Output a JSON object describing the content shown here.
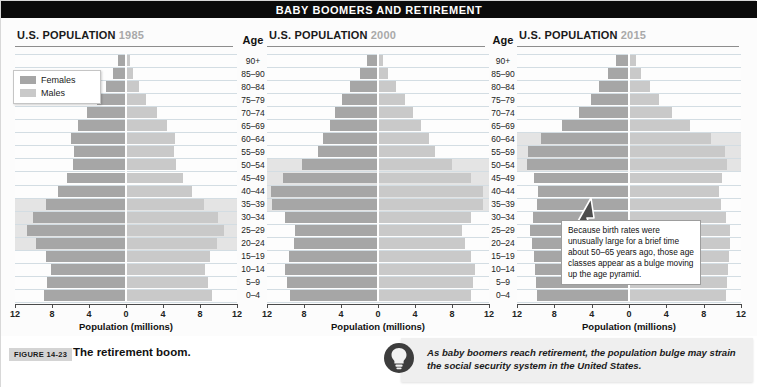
{
  "banner": {
    "title": "BABY BOOMERS AND RETIREMENT"
  },
  "legend": {
    "females_label": "Females",
    "males_label": "Males",
    "female_color": "#a6a6a6",
    "male_color": "#c9c9c9"
  },
  "age_header": "Age",
  "age_groups": [
    "90+",
    "85–90",
    "80–84",
    "75–79",
    "70–74",
    "65–69",
    "60–64",
    "55–59",
    "50–54",
    "45–49",
    "40–44",
    "35–39",
    "30–34",
    "25–29",
    "20–24",
    "15–19",
    "10–14",
    "5–9",
    "0–4"
  ],
  "axis": {
    "ticks": [
      "12",
      "8",
      "4",
      "0",
      "4",
      "8",
      "12"
    ],
    "tick_values": [
      -12,
      -8,
      -4,
      0,
      4,
      8,
      12
    ],
    "xlabel": "Population (millions)",
    "xlim": [
      -12,
      12
    ]
  },
  "panels": [
    {
      "title": "U.S. POPULATION",
      "year": "1985"
    },
    {
      "title": "U.S. POPULATION",
      "year": "2000"
    },
    {
      "title": "U.S. POPULATION",
      "year": "2015"
    }
  ],
  "callout": {
    "text": "Because birth rates were unusually large for a brief time about 50–65 years ago, those age classes appear as a bulge moving up the age pyramid."
  },
  "figure": {
    "label": "FIGURE 14-23",
    "caption": "The retirement boom."
  },
  "note": {
    "icon": "lightbulb-icon",
    "text": "As baby boomers reach retirement, the population bulge may strain the social security system in the United States."
  },
  "chart_data": {
    "type": "bar",
    "title": "BABY BOOMERS AND RETIREMENT",
    "subtitle": "U.S. population age structure pyramids for 1985, 2000 and 2015",
    "xlabel": "Population (millions)",
    "ylabel": "Age",
    "xlim": [
      -12,
      12
    ],
    "grid": true,
    "legend_position": "top-left",
    "categories": [
      "90+",
      "85–90",
      "80–84",
      "75–79",
      "70–74",
      "65–69",
      "60–64",
      "55–59",
      "50–54",
      "45–49",
      "40–44",
      "35–39",
      "30–34",
      "25–29",
      "20–24",
      "15–19",
      "10–14",
      "5–9",
      "0–4"
    ],
    "panels": [
      {
        "year": "1985",
        "bulge_ages": [
          "35–39",
          "30–34",
          "25–29",
          "20–24"
        ],
        "series": [
          {
            "name": "Females",
            "side": "left",
            "values": [
              0.9,
              1.4,
              2.2,
              3.1,
              4.2,
              5.2,
              5.9,
              5.6,
              5.7,
              6.4,
              7.3,
              8.6,
              10.1,
              10.7,
              9.7,
              8.7,
              8.1,
              8.5,
              8.9
            ]
          },
          {
            "name": "Males",
            "side": "right",
            "values": [
              0.4,
              0.8,
              1.4,
              2.2,
              3.3,
              4.4,
              5.3,
              5.2,
              5.4,
              6.2,
              7.1,
              8.4,
              9.9,
              10.6,
              9.8,
              9.1,
              8.5,
              8.9,
              9.3
            ]
          }
        ]
      },
      {
        "year": "2000",
        "bulge_ages": [
          "50–54",
          "45–49",
          "40–44",
          "35–39"
        ],
        "series": [
          {
            "name": "Females",
            "side": "left",
            "values": [
              1.2,
              1.9,
              3.0,
              3.9,
              4.6,
              5.2,
              5.9,
              6.5,
              8.2,
              10.3,
              11.6,
              11.5,
              10.1,
              9.0,
              9.1,
              9.6,
              10.0,
              9.8,
              9.5
            ]
          },
          {
            "name": "Males",
            "side": "right",
            "values": [
              0.5,
              1.1,
              2.0,
              2.9,
              3.8,
              4.6,
              5.5,
              6.2,
              8.0,
              10.1,
              11.4,
              11.4,
              10.0,
              9.1,
              9.4,
              10.1,
              10.5,
              10.3,
              10.0
            ]
          }
        ]
      },
      {
        "year": "2015",
        "bulge_ages": [
          "60–64",
          "55–59",
          "50–54"
        ],
        "series": [
          {
            "name": "Females",
            "side": "left",
            "values": [
              1.4,
              2.2,
              3.2,
              4.1,
              5.4,
              7.2,
              9.4,
              10.8,
              10.9,
              10.2,
              9.7,
              9.9,
              10.3,
              10.6,
              10.4,
              10.2,
              10.1,
              10.0,
              9.9
            ]
          },
          {
            "name": "Males",
            "side": "right",
            "values": [
              0.7,
              1.3,
              2.2,
              3.2,
              4.6,
              6.5,
              8.8,
              10.3,
              10.5,
              10.0,
              9.6,
              9.9,
              10.4,
              10.8,
              10.8,
              10.7,
              10.6,
              10.5,
              10.4
            ]
          }
        ]
      }
    ]
  }
}
